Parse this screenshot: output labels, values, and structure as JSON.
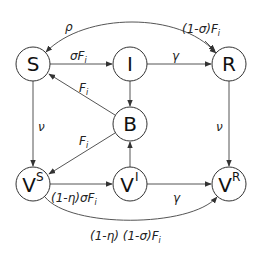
{
  "diagram": {
    "title": "",
    "nodes": [
      {
        "id": "S",
        "label": "S",
        "sup": "",
        "cx": 33,
        "cy": 64
      },
      {
        "id": "I",
        "label": "I",
        "sup": "",
        "cx": 130,
        "cy": 64
      },
      {
        "id": "R",
        "label": "R",
        "sup": "",
        "cx": 229,
        "cy": 64
      },
      {
        "id": "B",
        "label": "B",
        "sup": "",
        "cx": 130,
        "cy": 124
      },
      {
        "id": "VS",
        "label": "V",
        "sup": "S",
        "cx": 33,
        "cy": 184
      },
      {
        "id": "VI",
        "label": "V",
        "sup": "I",
        "cx": 130,
        "cy": 184
      },
      {
        "id": "VR",
        "label": "V",
        "sup": "R",
        "cx": 229,
        "cy": 184
      }
    ],
    "edges": [
      {
        "from": "R",
        "to": "S",
        "label": "ρ"
      },
      {
        "from": "S",
        "to": "R",
        "label_main": "(1-σ)F",
        "label_sub": "i"
      },
      {
        "from": "S",
        "to": "I",
        "label_main": "σF",
        "label_sub": "i"
      },
      {
        "from": "I",
        "to": "R",
        "label": "γ"
      },
      {
        "from": "I",
        "to": "B",
        "label": ""
      },
      {
        "from": "B",
        "to": "S",
        "label_main": "F",
        "label_sub": "i"
      },
      {
        "from": "B",
        "to": "VS",
        "label_main": "F",
        "label_sub": "i"
      },
      {
        "from": "S",
        "to": "VS",
        "label": "ν"
      },
      {
        "from": "R",
        "to": "VR",
        "label": "ν"
      },
      {
        "from": "VI",
        "to": "B",
        "label": ""
      },
      {
        "from": "VS",
        "to": "VI",
        "label_main": "(1-η)σF",
        "label_sub": "i"
      },
      {
        "from": "VI",
        "to": "VR",
        "label": "γ"
      },
      {
        "from": "VS",
        "to": "VR",
        "label_main": "(1-η) (1-σ)F",
        "label_sub": "i"
      }
    ]
  },
  "labels": {
    "rho": "ρ",
    "top_curve_main": "(1-σ)F",
    "top_curve_sub": "i",
    "s_to_i_main": "σF",
    "s_to_i_sub": "i",
    "i_to_r": "γ",
    "b_to_s_main": "F",
    "b_to_s_sub": "i",
    "b_to_vs_main": "F",
    "b_to_vs_sub": "i",
    "s_to_vs": "ν",
    "r_to_vr": "ν",
    "vs_to_vi_main": "(1-η)σF",
    "vs_to_vi_sub": "i",
    "vi_to_vr": "γ",
    "bottom_curve_main": "(1-η) (1-σ)F",
    "bottom_curve_sub": "i"
  },
  "node_labels": {
    "S": "S",
    "I": "I",
    "R": "R",
    "B": "B",
    "VS": "V",
    "VS_sup": "S",
    "VI": "V",
    "VI_sup": "I",
    "VR": "V",
    "VR_sup": "R"
  }
}
